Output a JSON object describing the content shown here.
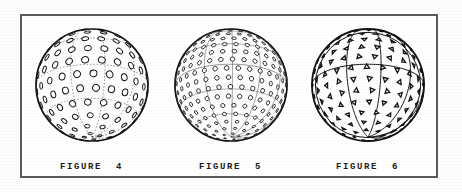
{
  "document": {
    "kind": "patent-drawing-sheet",
    "background_color": "#fdfdfd",
    "paper_color": "#ffffff",
    "ink_color": "#111111",
    "frame_color": "#5a5a5a"
  },
  "figures": [
    {
      "id": "figure-4",
      "label": "FIGURE  4",
      "subject": "golf ball",
      "dimple_shape": "circle",
      "dimple_count_visible": 96,
      "dimple_size": "large",
      "pattern": "icosahedral great-circle latitude rows",
      "construction_lines": "dashed great circles"
    },
    {
      "id": "figure-5",
      "label": "FIGURE  5",
      "subject": "golf ball",
      "dimple_shape": "circle",
      "dimple_count_visible": 188,
      "dimple_size": "small",
      "pattern": "dense hexagonal latitude rows",
      "construction_lines": "solid great circles"
    },
    {
      "id": "figure-6",
      "label": "FIGURE  6",
      "subject": "golf ball",
      "dimple_shape": "triangle",
      "dimple_count_visible": 120,
      "dimple_size": "medium",
      "pattern": "icosahedral triangular tessellation, alternating orientation",
      "construction_lines": "solid icosahedron edges through poles"
    }
  ],
  "geometry": {
    "frame": {
      "x": 20,
      "y": 14,
      "width": 418,
      "height": 164
    },
    "ball_diameter": 118,
    "ball_centers": [
      {
        "figure": "figure-4",
        "cx": 86,
        "cy": 84
      },
      {
        "figure": "figure-5",
        "cx": 224,
        "cy": 84
      },
      {
        "figure": "figure-6",
        "cx": 361,
        "cy": 84
      }
    ]
  }
}
